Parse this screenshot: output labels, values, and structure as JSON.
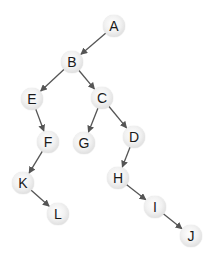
{
  "diagram": {
    "type": "tree",
    "colors": {
      "background": "#ffffff",
      "node_fill": "#e6e6e6",
      "edge": "#555555",
      "label": "#1a1a1a"
    },
    "nodes": [
      {
        "id": "A",
        "label": "A",
        "x": 114,
        "y": 26
      },
      {
        "id": "B",
        "label": "B",
        "x": 72,
        "y": 62
      },
      {
        "id": "E",
        "label": "E",
        "x": 32,
        "y": 99
      },
      {
        "id": "C",
        "label": "C",
        "x": 102,
        "y": 98
      },
      {
        "id": "F",
        "label": "F",
        "x": 48,
        "y": 142
      },
      {
        "id": "G",
        "label": "G",
        "x": 84,
        "y": 143
      },
      {
        "id": "D",
        "label": "D",
        "x": 134,
        "y": 137
      },
      {
        "id": "K",
        "label": "K",
        "x": 23,
        "y": 183
      },
      {
        "id": "H",
        "label": "H",
        "x": 118,
        "y": 178
      },
      {
        "id": "L",
        "label": "L",
        "x": 58,
        "y": 214
      },
      {
        "id": "I",
        "label": "I",
        "x": 155,
        "y": 207
      },
      {
        "id": "J",
        "label": "J",
        "x": 191,
        "y": 236
      }
    ],
    "edges": [
      {
        "from": "A",
        "to": "B"
      },
      {
        "from": "B",
        "to": "E"
      },
      {
        "from": "B",
        "to": "C"
      },
      {
        "from": "E",
        "to": "F"
      },
      {
        "from": "C",
        "to": "G"
      },
      {
        "from": "C",
        "to": "D"
      },
      {
        "from": "F",
        "to": "K"
      },
      {
        "from": "K",
        "to": "L"
      },
      {
        "from": "D",
        "to": "H"
      },
      {
        "from": "H",
        "to": "I"
      },
      {
        "from": "I",
        "to": "J"
      }
    ]
  }
}
